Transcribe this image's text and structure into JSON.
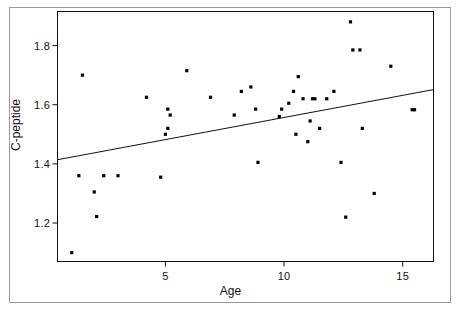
{
  "chart_data": {
    "type": "scatter",
    "title": "",
    "xlabel": "Age",
    "ylabel": "C-peptide",
    "xlim": [
      0.45,
      16.3
    ],
    "ylim": [
      1.07,
      1.915
    ],
    "grid": false,
    "legend": null,
    "xticks": [
      5,
      10,
      15
    ],
    "xtick_labels": [
      "5",
      "10",
      "15"
    ],
    "yticks": [
      1.2,
      1.4,
      1.6,
      1.8
    ],
    "ytick_labels": [
      "1.2",
      "1.4",
      "1.6",
      "1.8"
    ],
    "marker": "filled-square",
    "marker_color": "#000000",
    "series": [
      {
        "name": "observations",
        "x": [
          1.05,
          1.5,
          2.0,
          2.1,
          2.4,
          4.2,
          4.8,
          5.0,
          5.1,
          5.1,
          5.2,
          5.9,
          6.9,
          7.9,
          8.2,
          8.6,
          8.8,
          8.9,
          9.8,
          9.9,
          10.2,
          10.4,
          10.5,
          10.6,
          10.8,
          11.0,
          11.1,
          11.2,
          11.3,
          11.5,
          11.8,
          12.1,
          12.4,
          12.6,
          12.8,
          12.9,
          13.2,
          13.3,
          13.8,
          14.5,
          15.4,
          15.5
        ],
        "y": [
          1.1,
          1.7,
          1.305,
          1.222,
          1.36,
          1.625,
          1.355,
          1.5,
          1.52,
          1.585,
          1.565,
          1.715,
          1.625,
          1.565,
          1.645,
          1.66,
          1.585,
          1.405,
          1.56,
          1.585,
          1.605,
          1.645,
          1.5,
          1.695,
          1.62,
          1.475,
          1.545,
          1.62,
          1.62,
          1.52,
          1.62,
          1.645,
          1.405,
          1.22,
          1.88,
          1.785,
          1.785,
          1.52,
          1.3,
          1.73,
          1.583,
          1.583
        ]
      }
    ],
    "fit_line": {
      "name": "least-squares-fit",
      "x": [
        0.45,
        16.3
      ],
      "y": [
        1.414,
        1.651
      ],
      "color": "#111111"
    },
    "extra_points": [
      {
        "x": 1.35,
        "y": 1.36
      },
      {
        "x": 3.0,
        "y": 1.36
      }
    ]
  },
  "axes": {
    "x_title": "Age",
    "y_title": "C-peptide"
  }
}
